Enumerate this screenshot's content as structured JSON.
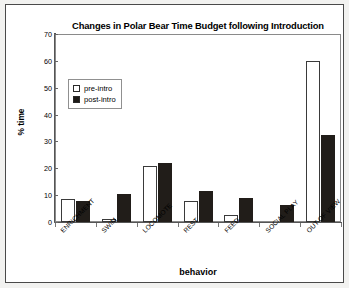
{
  "chart_data": {
    "type": "bar",
    "title": "Changes in Polar Bear Time Budget following Introduction",
    "xlabel": "behavior",
    "ylabel": "% time",
    "ylim": [
      0,
      70
    ],
    "ytick_step": 10,
    "yticks": [
      0,
      10,
      20,
      30,
      40,
      50,
      60,
      70
    ],
    "grid": false,
    "legend_position": "upper-left inside plot",
    "categories": [
      "ENRICHMENT",
      "SWIM",
      "LOCOMOTE",
      "REST",
      "FEED",
      "SOCIAL PLAY",
      "OUT OF VIEW"
    ],
    "series": [
      {
        "name": "pre-intro",
        "color": "#ffffff",
        "edge_color": "#3a3a3a",
        "values": [
          8.5,
          1.0,
          20.7,
          8.0,
          2.5,
          0.0,
          60.0
        ]
      },
      {
        "name": "post-intro",
        "color": "#211d19",
        "edge_color": "#211d19",
        "values": [
          8.0,
          10.5,
          21.8,
          11.5,
          8.8,
          6.5,
          32.5
        ]
      }
    ]
  },
  "figure": {
    "frame_border_color": "#4a4a4a",
    "background": "#ffffff",
    "page_background": "#f2f2f0"
  }
}
